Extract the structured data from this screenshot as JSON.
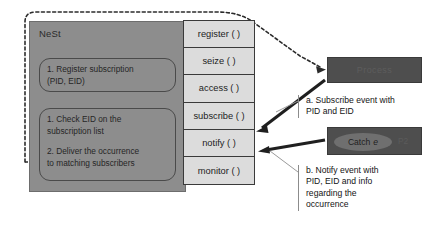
{
  "diagram": {
    "nest": {
      "label": "NeSt",
      "steps": [
        {
          "id": "register-subscription",
          "line1": "1. Register subscription",
          "line2": "(PID, EID)"
        },
        {
          "id": "check-and-deliver",
          "line1": "1. Check EID on the",
          "line2": "subscription list",
          "line3": "2. Deliver the occurrence",
          "line4": "to matching subscribers"
        }
      ]
    },
    "methods": [
      {
        "id": "register",
        "label": "register ( )"
      },
      {
        "id": "seize",
        "label": "seize ( )"
      },
      {
        "id": "access",
        "label": "access ( )"
      },
      {
        "id": "subscribe",
        "label": "subscribe ( )"
      },
      {
        "id": "notify",
        "label": "notify ( )"
      },
      {
        "id": "monitor",
        "label": "monitor ( )"
      }
    ],
    "processes": [
      {
        "id": "p1",
        "title": "Process"
      },
      {
        "id": "p2",
        "catch_lead": "Catch",
        "catch_event": "e",
        "tag": "P2"
      }
    ],
    "captions": [
      {
        "id": "subscribe-event",
        "line1": "a. Subscribe event with",
        "line2": "PID and EID"
      },
      {
        "id": "notify-event",
        "line1": "b. Notify event with",
        "line2": "PID, EID and info",
        "line3": "regarding the",
        "line4": "occurrence"
      }
    ],
    "colors": {
      "nest_fill": "#8d8d8d",
      "method_fill": "#dcdcdc",
      "process_fill": "#4e4e4e",
      "stroke": "#2b2b2b"
    }
  }
}
